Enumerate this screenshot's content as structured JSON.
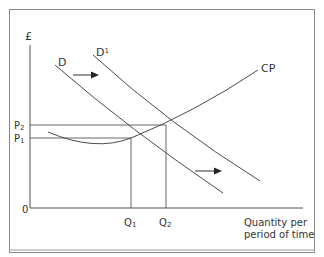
{
  "diagram": {
    "y_axis_label": "£",
    "x_axis_label_line1": "Quantity per",
    "x_axis_label_line2": "period of time",
    "origin_label": "0",
    "price_labels": [
      {
        "main": "P",
        "sub": "2"
      },
      {
        "main": "P",
        "sub": "1"
      }
    ],
    "quantity_labels": [
      {
        "main": "Q",
        "sub": "1"
      },
      {
        "main": "Q",
        "sub": "2"
      }
    ],
    "curves": [
      {
        "name": "D",
        "label": "D"
      },
      {
        "name": "D1",
        "label": "D",
        "sup": "1"
      },
      {
        "name": "CP",
        "label": "CP"
      }
    ],
    "line_color": "#4a4a4a"
  }
}
